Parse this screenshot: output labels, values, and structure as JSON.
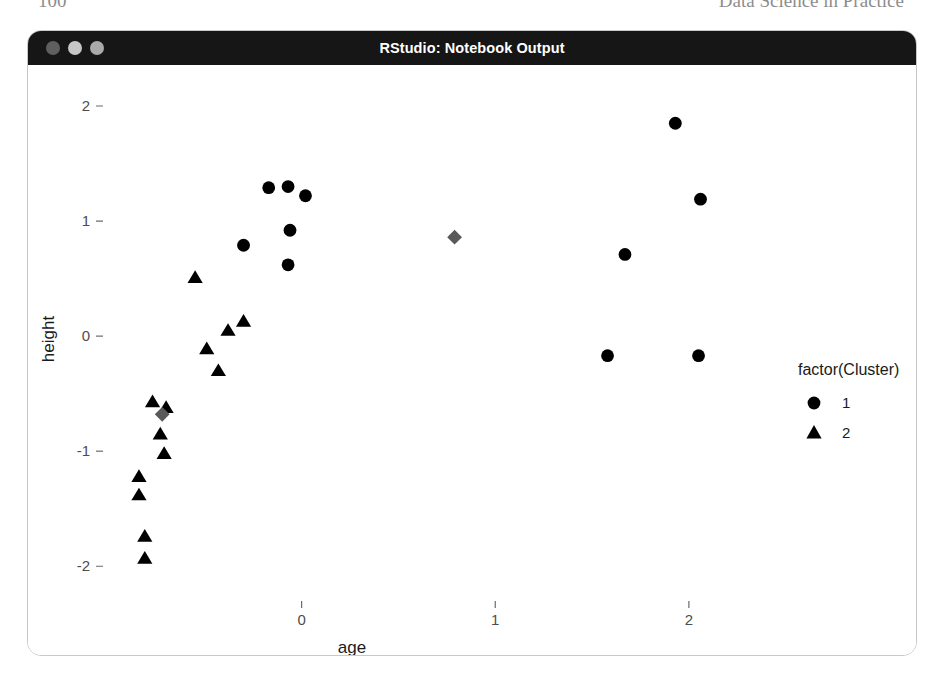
{
  "page_header": {
    "folio": "100",
    "running_title": "Data Science in Practice"
  },
  "window": {
    "title": "RStudio: Notebook Output",
    "traffic_lights": [
      {
        "name": "close-button",
        "label": "Close",
        "color": "#5f5f5f"
      },
      {
        "name": "minimize-button",
        "label": "Minimize",
        "color": "#c6c6c6"
      },
      {
        "name": "zoom-button",
        "label": "Zoom",
        "color": "#aaaaaa"
      }
    ]
  },
  "chart_data": {
    "type": "scatter",
    "title": "",
    "xlabel": "age",
    "ylabel": "height",
    "xlim": [
      -1.0,
      2.45
    ],
    "ylim": [
      -2.25,
      2.2
    ],
    "xticks": [
      0,
      1,
      2
    ],
    "xtick_labels": [
      "0",
      "1",
      "2"
    ],
    "yticks": [
      -2,
      -1,
      0,
      1,
      2
    ],
    "ytick_labels": [
      "-2",
      "-1",
      "0",
      "1",
      "2"
    ],
    "grid": false,
    "legend_position": "right",
    "legend": {
      "title": "factor(Cluster)",
      "entries": [
        {
          "label": "1",
          "marker": "circle",
          "color": "#000000"
        },
        {
          "label": "2",
          "marker": "triangle",
          "color": "#000000"
        }
      ]
    },
    "series": [
      {
        "name": "1",
        "marker": "circle",
        "color": "#000000",
        "points": [
          {
            "x": -0.17,
            "y": 1.29
          },
          {
            "x": -0.07,
            "y": 1.3
          },
          {
            "x": 0.02,
            "y": 1.22
          },
          {
            "x": -0.06,
            "y": 0.92
          },
          {
            "x": -0.3,
            "y": 0.79
          },
          {
            "x": -0.07,
            "y": 0.62
          },
          {
            "x": 1.93,
            "y": 1.85
          },
          {
            "x": 2.06,
            "y": 1.19
          },
          {
            "x": 1.67,
            "y": 0.71
          },
          {
            "x": 1.58,
            "y": -0.17
          },
          {
            "x": 2.05,
            "y": -0.17
          }
        ]
      },
      {
        "name": "2",
        "marker": "triangle",
        "color": "#000000",
        "points": [
          {
            "x": -0.55,
            "y": 0.51
          },
          {
            "x": -0.38,
            "y": 0.05
          },
          {
            "x": -0.49,
            "y": -0.11
          },
          {
            "x": -0.3,
            "y": 0.13
          },
          {
            "x": -0.43,
            "y": -0.3
          },
          {
            "x": -0.77,
            "y": -0.57
          },
          {
            "x": -0.7,
            "y": -0.62
          },
          {
            "x": -0.73,
            "y": -0.85
          },
          {
            "x": -0.71,
            "y": -1.02
          },
          {
            "x": -0.84,
            "y": -1.22
          },
          {
            "x": -0.84,
            "y": -1.38
          },
          {
            "x": -0.81,
            "y": -1.74
          },
          {
            "x": -0.81,
            "y": -1.93
          }
        ]
      },
      {
        "name": "centroids",
        "marker": "diamond",
        "color": "#595959",
        "points": [
          {
            "x": 0.79,
            "y": 0.86
          },
          {
            "x": -0.72,
            "y": -0.68
          }
        ]
      }
    ]
  }
}
